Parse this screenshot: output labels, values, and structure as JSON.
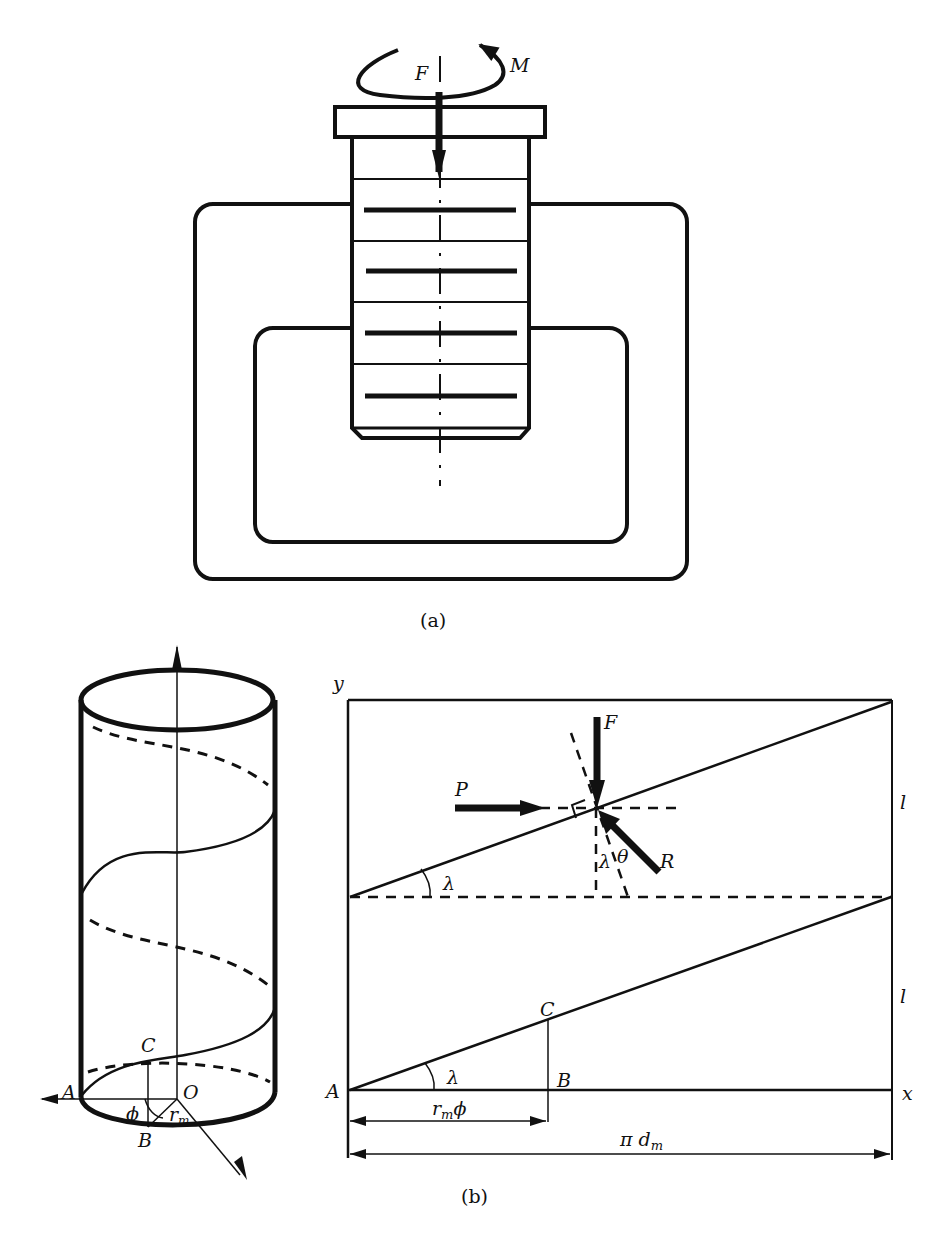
{
  "figure": {
    "panel_a": {
      "caption": "(a)",
      "labels": {
        "force": "F",
        "moment": "M"
      },
      "thread_count": 4
    },
    "panel_b": {
      "caption": "(b)",
      "cylinder": {
        "labels": {
          "A": "A",
          "B": "B",
          "C": "C",
          "O": "O",
          "phi": "ϕ",
          "r_m": "r",
          "r_m_sub": "m"
        }
      },
      "unrolled": {
        "axis_labels": {
          "y": "y",
          "x": "x"
        },
        "pitch_labels": [
          "l",
          "l"
        ],
        "point_labels": {
          "A": "A",
          "B": "B",
          "C": "C"
        },
        "force_labels": {
          "F": "F",
          "P": "P",
          "R": "R"
        },
        "angle_labels": {
          "lambda": "λ",
          "theta": "θ"
        },
        "dimensions": {
          "arc": {
            "main": "r",
            "sub": "m",
            "suffix": "ϕ"
          },
          "circumference": {
            "main": "π d",
            "sub": "m"
          }
        }
      }
    }
  },
  "colors": {
    "ink": "#111111",
    "background": "#ffffff"
  }
}
